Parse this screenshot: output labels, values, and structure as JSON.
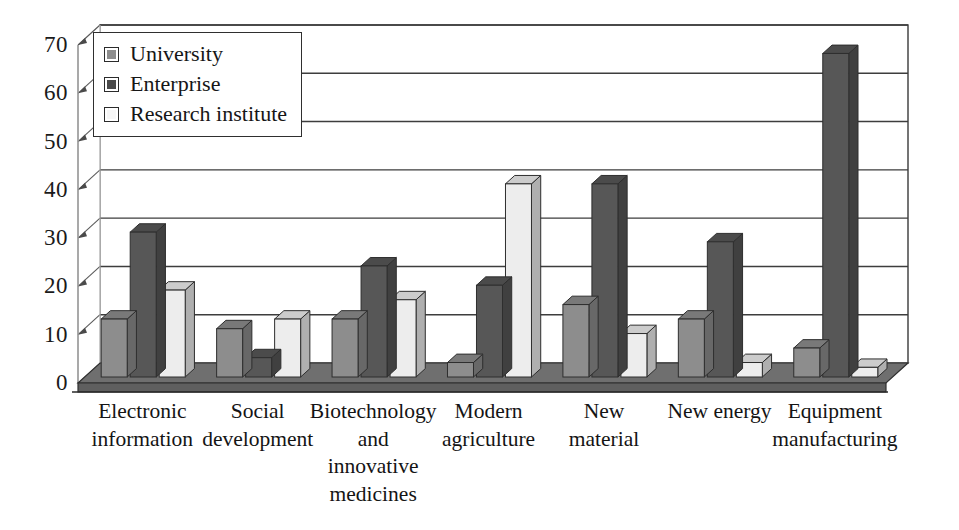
{
  "chart_data": {
    "type": "bar",
    "title": "",
    "subtitle": "",
    "xlabel": "",
    "ylabel": "",
    "ylim": [
      0,
      70
    ],
    "yticks": [
      0,
      10,
      20,
      30,
      40,
      50,
      60,
      70
    ],
    "grid": true,
    "three_d": true,
    "legend_position": "top-left",
    "categories": [
      "Electronic\ninformation",
      "Social\ndevelopment",
      "Biotechnology\nand\ninnovative\nmedicines",
      "Modern\nagriculture",
      "New\nmaterial",
      "New energy",
      "Equipment\nmanufacturing"
    ],
    "series": [
      {
        "name": "University",
        "color": "#8d8d8d",
        "values": [
          12,
          10,
          12,
          3,
          15,
          12,
          6
        ]
      },
      {
        "name": "Enterprise",
        "color": "#575757",
        "values": [
          30,
          4,
          23,
          19,
          40,
          28,
          67
        ]
      },
      {
        "name": "Research institute",
        "color": "#ededed",
        "values": [
          18,
          12,
          16,
          40,
          9,
          3,
          2
        ]
      }
    ]
  },
  "legend": {
    "items": [
      {
        "label": "University",
        "swatch": "#8d8d8d"
      },
      {
        "label": "Enterprise",
        "swatch": "#4a4a4a"
      },
      {
        "label": "Research institute",
        "swatch": "#f6f6f6"
      }
    ]
  },
  "axis": {
    "y_tick_labels": [
      "0",
      "10",
      "20",
      "30",
      "40",
      "50",
      "60",
      "70"
    ]
  },
  "colors": {
    "university": "#8d8d8d",
    "enterprise": "#575757",
    "research_institute": "#ededed",
    "floor": "#6f6f6f",
    "outline": "#2e2e2e",
    "gridline": "#3d3d3d",
    "axis": "#9a9a9a"
  }
}
